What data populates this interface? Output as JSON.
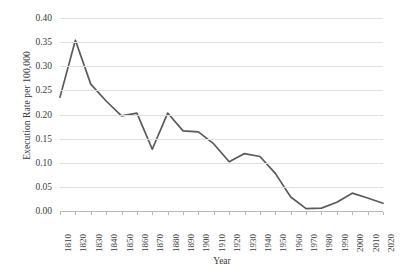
{
  "chart_data": {
    "type": "line",
    "title": "",
    "xlabel": "Year",
    "ylabel": "Execution Rate per 100,000",
    "xlim": [
      1810,
      2020
    ],
    "ylim": [
      0.0,
      0.4
    ],
    "grid": true,
    "legend": false,
    "line_color": "#5a5a5a",
    "gridline_color": "#e0e0e0",
    "categories": [
      "1810",
      "1820",
      "1830",
      "1840",
      "1850",
      "1860",
      "1870",
      "1880",
      "1890",
      "1900",
      "1910",
      "1920",
      "1930",
      "1940",
      "1950",
      "1960",
      "1970",
      "1980",
      "1990",
      "2000",
      "2010",
      "2020"
    ],
    "x": [
      1810,
      1820,
      1830,
      1840,
      1850,
      1860,
      1870,
      1880,
      1890,
      1900,
      1910,
      1920,
      1930,
      1940,
      1950,
      1960,
      1970,
      1980,
      1990,
      2000,
      2010,
      2020
    ],
    "values": [
      0.236,
      0.354,
      0.263,
      0.228,
      0.197,
      0.203,
      0.128,
      0.203,
      0.166,
      0.164,
      0.139,
      0.102,
      0.119,
      0.113,
      0.078,
      0.029,
      0.005,
      0.006,
      0.018,
      0.037,
      0.027,
      0.016
    ],
    "series": [
      {
        "name": "Execution Rate",
        "values": [
          0.236,
          0.354,
          0.263,
          0.228,
          0.197,
          0.203,
          0.128,
          0.203,
          0.166,
          0.164,
          0.139,
          0.102,
          0.119,
          0.113,
          0.078,
          0.029,
          0.005,
          0.006,
          0.018,
          0.037,
          0.027,
          0.016
        ]
      }
    ],
    "y_ticks": [
      0.0,
      0.05,
      0.1,
      0.15,
      0.2,
      0.25,
      0.3,
      0.35,
      0.4
    ],
    "y_tick_labels": [
      "0.00",
      "0.05",
      "0.10",
      "0.15",
      "0.20",
      "0.25",
      "0.30",
      "0.35",
      "0.40"
    ]
  }
}
